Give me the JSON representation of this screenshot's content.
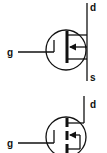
{
  "diagram": {
    "type": "MOSFET symbols",
    "symbols": [
      {
        "name": "depletion-mode n-channel MOSFET",
        "labels": {
          "gate": "g",
          "drain": "d",
          "source": "s"
        },
        "channel": "continuous"
      },
      {
        "name": "enhancement-mode n-channel MOSFET",
        "labels": {
          "gate": "g",
          "drain": "d"
        },
        "channel": "segmented"
      }
    ],
    "colors": {
      "stroke": "#111111",
      "background": "#ffffff"
    }
  }
}
